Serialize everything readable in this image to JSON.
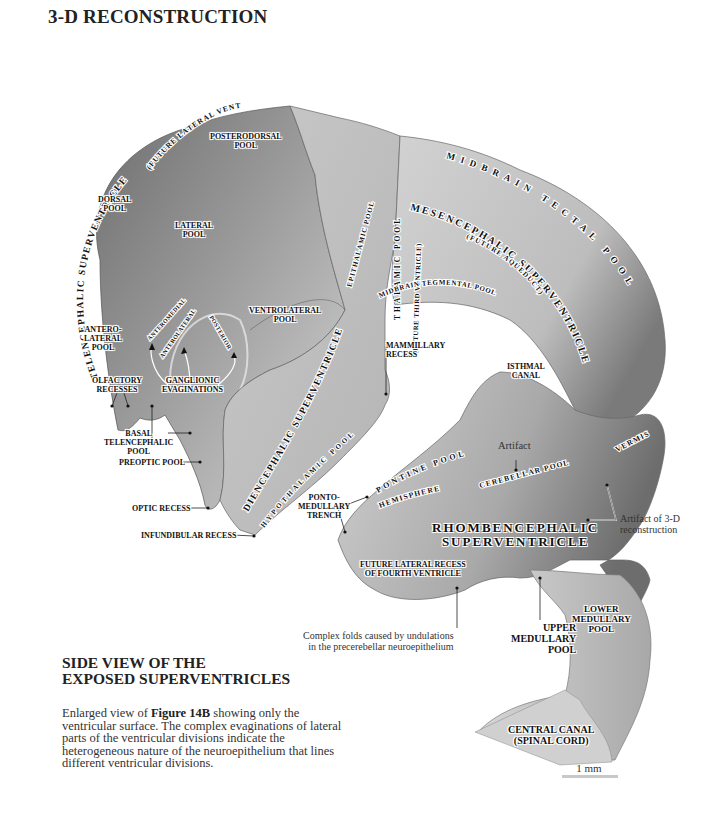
{
  "header": {
    "title": "3-D RECONSTRUCTION"
  },
  "figure": {
    "curved_labels": {
      "telencephalic": "TELENCEPHALIC SUPERVENTRICLE",
      "telencephalic_sub": "(FUTURE LATERAL VENTRICLE)",
      "thalamic_pool": "THALAMIC POOL",
      "future_third": "(FUTURE THIRD VENTRICLE)",
      "epithalamic": "EPITHALAMIC POOL",
      "midbrain_tectal": "MIDBRAIN TECTAL POOL",
      "mesencephalic": "MESENCEPHALIC SUPERVENTRICLE",
      "future_aqueduct": "(FUTURE AQUEDUCT)",
      "midbrain_tegmental": "MIDBRAIN TEGMENTAL POOL",
      "diencephalic": "DIENCEPHALIC SUPERVENTRICLE",
      "hypothalamic": "HYPOTHALAMIC POOL",
      "pontine": "PONTINE POOL",
      "hemisphere": "HEMISPHERE",
      "cerebellar": "CEREBELLAR POOL",
      "vermis": "VERMIS",
      "anteromedial": "ANTEROMEDIAL",
      "anterolateral": "ANTEROLATERAL",
      "posterior": "POSTERIOR"
    },
    "labels": {
      "posterodorsal": "POSTERODORSAL\nPOOL",
      "dorsal": "DORSAL\nPOOL",
      "lateral": "LATERAL\nPOOL",
      "ventrolateral": "VENTROLATERAL\nPOOL",
      "anterolateral_pool": "ANTERO-\nLATERAL\nPOOL",
      "olfactory": "OLFACTORY\nRECESSES",
      "ganglionic": "GANGLIONIC\nEVAGINATIONS",
      "basal_telencephalic": "BASAL\nTELENCEPHALIC\nPOOL",
      "preoptic": "PREOPTIC POOL",
      "optic_recess": "OPTIC RECESS",
      "infundibular": "INFUNDIBULAR RECESS",
      "mammillary": "MAMMILLARY\nRECESS",
      "isthmal": "ISTHMAL\nCANAL",
      "pontomedullary": "PONTO-\nMEDULLARY\nTRENCH",
      "future_lateral_recess": "FUTURE LATERAL RECESS\nOF FOURTH VENTRICLE",
      "upper_medullary": "UPPER\nMEDULLARY\nPOOL",
      "lower_medullary": "LOWER\nMEDULLARY\nPOOL",
      "central_canal": "CENTRAL CANAL\n(SPINAL CORD)",
      "rhombencephalic": "RHOMBENCEPHALIC\nSUPERVENTRICLE"
    },
    "notes": {
      "artifact": "Artifact",
      "artifact_3d": "Artifact of 3-D\nreconstruction",
      "complex_folds": "Complex folds caused by undulations\nin the precerebellar neuroepithelium"
    },
    "scale": {
      "label": "1 mm"
    }
  },
  "section": {
    "title": "SIDE VIEW OF THE\nEXPOSED SUPERVENTRICLES",
    "caption_pre": "Enlarged view of ",
    "caption_bold": "Figure 14B",
    "caption_post": " showing only the ventricular surface.  The complex evaginations of lateral parts of the ventricular divisions indicate the heterogeneous nature of the neuroepithelium that lines different ventricular divisions."
  }
}
